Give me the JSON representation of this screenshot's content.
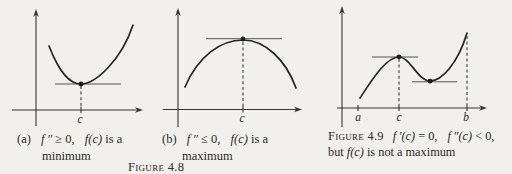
{
  "page": {
    "background": "#f1f0ec",
    "ink": "#2b2a26"
  },
  "figure_4_8": {
    "label": "Figure 4.8",
    "panel_a": {
      "index": "(a)",
      "math_f2": "f ″",
      "relation": "≥ 0,",
      "math_fc": "f(c)",
      "suffix": "is a",
      "line2": "minimum",
      "x_tick_label": "c"
    },
    "panel_b": {
      "index": "(b)",
      "math_f2": "f ″",
      "relation": "≤ 0,",
      "math_fc": "f(c)",
      "suffix": "is a",
      "line2": "maximum",
      "x_tick_label": "c"
    }
  },
  "figure_4_9": {
    "label": "Figure 4.9",
    "math_fpc": "f ′(c)",
    "rel1": "= 0,",
    "math_fppc": "f ″(c)",
    "rel2": "< 0,",
    "line2_prefix": "but",
    "line2_math": "f(c)",
    "line2_suffix": "is not a maximum",
    "x_tick_labels": {
      "a": "a",
      "c": "c",
      "b": "b"
    }
  }
}
